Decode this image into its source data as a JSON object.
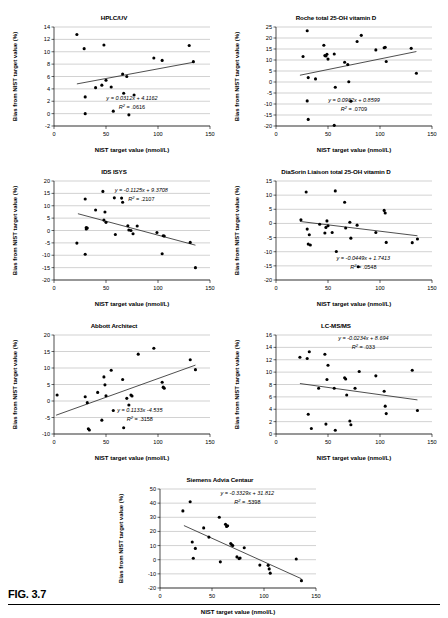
{
  "figure": {
    "caption": "FIG. 3.7"
  },
  "common": {
    "xlabel": "NIST target value (nmol/L)",
    "ylabel": "Bias from NIST target value (%)",
    "xticks": [
      0,
      50,
      100,
      150
    ]
  },
  "chart_data": [
    {
      "id": "hplc-uv",
      "type": "scatter",
      "title": "HPLC/UV",
      "xlabel": "NIST target value (nmol/L)",
      "ylabel": "Bias from NIST target value (%)",
      "xlim": [
        0,
        150
      ],
      "ylim": [
        -2,
        14
      ],
      "xticks": [
        0,
        50,
        100,
        150
      ],
      "yticks": [
        -2,
        0,
        2,
        4,
        6,
        8,
        10,
        12,
        14
      ],
      "grid": true,
      "equation": "y = 0.0312x  + 4.1162",
      "r2": "R2 = .0616",
      "r2_value": ".0616",
      "slope": 0.0312,
      "intercept": 4.1162,
      "fit_x_range": [
        22,
        135
      ],
      "points": [
        [
          22,
          12.8
        ],
        [
          29,
          10.5
        ],
        [
          30,
          2.7
        ],
        [
          30,
          0.0
        ],
        [
          40,
          4.2
        ],
        [
          46,
          4.6
        ],
        [
          48,
          11.1
        ],
        [
          50,
          5.4
        ],
        [
          55,
          4.3
        ],
        [
          57,
          0.4
        ],
        [
          66,
          6.4
        ],
        [
          67,
          3.3
        ],
        [
          70,
          6.0
        ],
        [
          72,
          -0.2
        ],
        [
          77,
          3.0
        ],
        [
          96,
          9.0
        ],
        [
          104,
          8.6
        ],
        [
          130,
          11.0
        ],
        [
          134,
          8.4
        ]
      ]
    },
    {
      "id": "roche",
      "type": "scatter",
      "title": "Roche total 25-OH vitamin D",
      "xlabel": "NIST target value (nmol/L)",
      "ylabel": "Bias from NIST target value (%)",
      "xlim": [
        0,
        150
      ],
      "ylim": [
        -20,
        25
      ],
      "xticks": [
        0,
        50,
        100,
        150
      ],
      "yticks": [
        -20,
        -15,
        -10,
        -5,
        0,
        5,
        10,
        15,
        20,
        25
      ],
      "grid": true,
      "equation": "y = 0.0962x  + 0.8599",
      "r2": "R2 = .0709",
      "r2_value": ".0709",
      "slope": 0.0962,
      "intercept": 0.8599,
      "fit_x_range": [
        23,
        135
      ],
      "points": [
        [
          26,
          11.6
        ],
        [
          30,
          23.3
        ],
        [
          30,
          -8.6
        ],
        [
          31,
          2.0
        ],
        [
          31,
          -17.0
        ],
        [
          38,
          1.4
        ],
        [
          46,
          16.7
        ],
        [
          47,
          12.0
        ],
        [
          48,
          11.8
        ],
        [
          49,
          12.6
        ],
        [
          50,
          10.4
        ],
        [
          56,
          12.7
        ],
        [
          56,
          -19.7
        ],
        [
          57,
          -2.4
        ],
        [
          66,
          9.0
        ],
        [
          69,
          7.9
        ],
        [
          70,
          0.1
        ],
        [
          72,
          -8.7
        ],
        [
          78,
          18.4
        ],
        [
          82,
          21.2
        ],
        [
          96,
          14.6
        ],
        [
          104,
          15.6
        ],
        [
          105,
          15.8
        ],
        [
          106,
          9.3
        ],
        [
          130,
          15.3
        ],
        [
          135,
          4.0
        ]
      ]
    },
    {
      "id": "ids-isys",
      "type": "scatter",
      "title": "IDS ISYS",
      "xlabel": "NIST target value (nmol/L)",
      "ylabel": "Bias from NIST target value (%)",
      "xlim": [
        0,
        150
      ],
      "ylim": [
        -20,
        20
      ],
      "xticks": [
        0,
        50,
        100,
        150
      ],
      "yticks": [
        -20,
        -15,
        -10,
        -5,
        0,
        5,
        10,
        15,
        20
      ],
      "grid": true,
      "equation": "y = -0.1125x  + 9.3708",
      "r2": "R2 = .2107",
      "r2_value": ".2107",
      "slope": -0.1125,
      "intercept": 9.3708,
      "fit_x_range": [
        23,
        136
      ],
      "points": [
        [
          22,
          -5.1
        ],
        [
          30,
          12.7
        ],
        [
          30,
          -9.6
        ],
        [
          31,
          1.2
        ],
        [
          31,
          0.6
        ],
        [
          32,
          1.0
        ],
        [
          40,
          8.3
        ],
        [
          47,
          15.8
        ],
        [
          48,
          4.2
        ],
        [
          49,
          7.5
        ],
        [
          50,
          3.3
        ],
        [
          58,
          13.2
        ],
        [
          59,
          -1.6
        ],
        [
          65,
          13.1
        ],
        [
          66,
          11.4
        ],
        [
          71,
          1.9
        ],
        [
          72,
          0.2
        ],
        [
          74,
          0.0
        ],
        [
          76,
          -1.3
        ],
        [
          80,
          1.8
        ],
        [
          99,
          -0.8
        ],
        [
          104,
          -9.4
        ],
        [
          105,
          -2.1
        ],
        [
          106,
          -2.2
        ],
        [
          131,
          -4.8
        ],
        [
          136,
          -15.0
        ]
      ]
    },
    {
      "id": "diasorin",
      "type": "scatter",
      "title": "DiaSorin Liaison total 25-OH vitamin D",
      "xlabel": "NIST target value (nmol/L)",
      "ylabel": "Bias from NIST target value (%)",
      "xlim": [
        0,
        150
      ],
      "ylim": [
        -20,
        15
      ],
      "xticks": [
        0,
        50,
        100,
        150
      ],
      "yticks": [
        -20,
        -15,
        -10,
        -5,
        0,
        5,
        10,
        15
      ],
      "grid": true,
      "equation": "y = -0.0449x  + 1.7413",
      "r2": "R2 = .0548",
      "r2_value": ".0548",
      "slope": -0.0449,
      "intercept": 1.7413,
      "fit_x_range": [
        23,
        136
      ],
      "points": [
        [
          24,
          1.3
        ],
        [
          29,
          11.1
        ],
        [
          30,
          -2.0
        ],
        [
          31,
          -7.3
        ],
        [
          32,
          -4.0
        ],
        [
          33,
          -7.6
        ],
        [
          42,
          -0.3
        ],
        [
          47,
          -3.4
        ],
        [
          48,
          -1.4
        ],
        [
          49,
          0.9
        ],
        [
          50,
          -0.8
        ],
        [
          54,
          -3.2
        ],
        [
          57,
          11.5
        ],
        [
          58,
          -9.9
        ],
        [
          66,
          7.5
        ],
        [
          67,
          -1.6
        ],
        [
          71,
          0.4
        ],
        [
          72,
          -5.2
        ],
        [
          78,
          -0.6
        ],
        [
          79,
          -15.3
        ],
        [
          96,
          -3.2
        ],
        [
          104,
          4.6
        ],
        [
          105,
          3.7
        ],
        [
          106,
          -6.7
        ],
        [
          131,
          -6.8
        ],
        [
          136,
          -5.5
        ]
      ]
    },
    {
      "id": "abbott",
      "type": "scatter",
      "title": "Abbott Architect",
      "xlabel": "NIST target value (nmol/L)",
      "ylabel": "Bias from NIST target value (%)",
      "xlim": [
        0,
        150
      ],
      "ylim": [
        -10,
        20
      ],
      "xticks": [
        0,
        50,
        100,
        150
      ],
      "yticks": [
        -10,
        -5,
        0,
        5,
        10,
        15,
        20
      ],
      "grid": true,
      "equation": "y = 0.1133x  -4.535",
      "r2": "R2 = .3158",
      "r2_value": ".3158",
      "slope": 0.1133,
      "intercept": -4.535,
      "fit_x_range": [
        2,
        136
      ],
      "points": [
        [
          3,
          1.8
        ],
        [
          30,
          1.3
        ],
        [
          32,
          -0.5
        ],
        [
          33,
          -8.4
        ],
        [
          34,
          -8.8
        ],
        [
          42,
          2.6
        ],
        [
          46,
          -5.8
        ],
        [
          48,
          7.3
        ],
        [
          49,
          4.9
        ],
        [
          50,
          1.6
        ],
        [
          55,
          9.3
        ],
        [
          57,
          -2.9
        ],
        [
          66,
          6.5
        ],
        [
          67,
          -8.1
        ],
        [
          70,
          0.8
        ],
        [
          72,
          -1.2
        ],
        [
          74,
          1.8
        ],
        [
          75,
          1.5
        ],
        [
          81,
          14.2
        ],
        [
          96,
          16.0
        ],
        [
          104,
          5.7
        ],
        [
          105,
          4.2
        ],
        [
          106,
          3.9
        ],
        [
          131,
          12.5
        ],
        [
          136,
          9.5
        ]
      ]
    },
    {
      "id": "lc-ms-ms",
      "type": "scatter",
      "title": "LC-MS/MS",
      "xlabel": "NIST target value (nmol/L)",
      "ylabel": "Bias from NIST target value (%)",
      "xlim": [
        0,
        150
      ],
      "ylim": [
        0,
        16
      ],
      "xticks": [
        0,
        50,
        100,
        150
      ],
      "yticks": [
        0,
        2,
        4,
        6,
        8,
        10,
        12,
        14,
        16
      ],
      "grid": true,
      "equation": "y = -0.0234x  + 8.694",
      "r2": "R2 = .033",
      "r2_value": ".033",
      "slope": -0.0234,
      "intercept": 8.694,
      "fit_x_range": [
        23,
        136
      ],
      "points": [
        [
          23,
          12.4
        ],
        [
          30,
          12.2
        ],
        [
          31,
          3.2
        ],
        [
          32,
          13.3
        ],
        [
          34,
          0.9
        ],
        [
          41,
          7.4
        ],
        [
          47,
          12.9
        ],
        [
          48,
          1.6
        ],
        [
          49,
          8.8
        ],
        [
          50,
          11.1
        ],
        [
          56,
          7.4
        ],
        [
          57,
          0.6
        ],
        [
          66,
          9.1
        ],
        [
          67,
          8.9
        ],
        [
          68,
          6.3
        ],
        [
          71,
          2.1
        ],
        [
          72,
          1.5
        ],
        [
          76,
          7.4
        ],
        [
          80,
          10.1
        ],
        [
          96,
          9.4
        ],
        [
          104,
          6.9
        ],
        [
          105,
          4.5
        ],
        [
          106,
          3.3
        ],
        [
          131,
          10.3
        ],
        [
          136,
          3.8
        ]
      ]
    },
    {
      "id": "siemens",
      "type": "scatter",
      "title": "Siemens Advia Centaur",
      "xlabel": "NIST target value (nmol/L)",
      "ylabel": "Bias from NIST target value (%)",
      "xlim": [
        0,
        150
      ],
      "ylim": [
        -20,
        50
      ],
      "xticks": [
        0,
        50,
        100,
        150
      ],
      "yticks": [
        -20,
        -10,
        0,
        10,
        20,
        30,
        40,
        50
      ],
      "grid": true,
      "equation": "y = -0.3329x  + 31.812",
      "r2": "R2 = .5398",
      "r2_value": ".5398",
      "slope": -0.3329,
      "intercept": 31.812,
      "fit_x_range": [
        23,
        136
      ],
      "points": [
        [
          22,
          34.5
        ],
        [
          29,
          41.0
        ],
        [
          31,
          12.5
        ],
        [
          32,
          1.0
        ],
        [
          34,
          8.0
        ],
        [
          42,
          22.5
        ],
        [
          47,
          16.0
        ],
        [
          57,
          30.0
        ],
        [
          58,
          -1.5
        ],
        [
          63,
          25.0
        ],
        [
          64,
          23.5
        ],
        [
          65,
          24.0
        ],
        [
          68,
          11.5
        ],
        [
          69,
          10.5
        ],
        [
          70,
          10.0
        ],
        [
          74,
          2.0
        ],
        [
          76,
          0.8
        ],
        [
          77,
          1.2
        ],
        [
          81,
          8.5
        ],
        [
          96,
          -3.8
        ],
        [
          104,
          -4.0
        ],
        [
          105,
          -6.5
        ],
        [
          106,
          -9.5
        ],
        [
          131,
          0.5
        ],
        [
          136,
          -14.8
        ]
      ]
    }
  ]
}
